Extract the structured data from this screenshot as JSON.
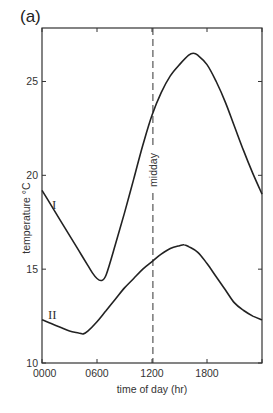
{
  "panel_label": "(a)",
  "chart_data": {
    "type": "line",
    "title": "",
    "xlabel": "time of day (hr)",
    "ylabel": "temperature °C",
    "xlim": [
      0,
      24
    ],
    "ylim": [
      10,
      27.5
    ],
    "x_ticks": [
      0,
      6,
      12,
      18,
      24
    ],
    "x_tick_labels": [
      "0000",
      "0600",
      "1200",
      "1800",
      ""
    ],
    "y_ticks": [
      10,
      15,
      20,
      25
    ],
    "y_tick_labels": [
      "10",
      "15",
      "20",
      "25"
    ],
    "grid": false,
    "legend": "none",
    "annotations": [
      {
        "type": "vline",
        "x": 12.1,
        "style": "dashed",
        "label": "midday"
      }
    ],
    "series": [
      {
        "name": "I",
        "x": [
          0,
          1,
          2,
          3,
          4,
          5,
          5.5,
          6,
          6.5,
          7,
          8,
          9,
          10,
          11,
          12,
          13,
          14,
          15,
          16,
          16.5,
          17,
          18,
          19,
          20,
          21,
          22,
          23,
          24
        ],
        "values": [
          19.2,
          18.4,
          17.6,
          16.8,
          16.0,
          15.2,
          14.8,
          14.5,
          14.4,
          14.7,
          16.3,
          18.0,
          19.8,
          21.6,
          23.2,
          24.4,
          25.3,
          25.9,
          26.4,
          26.5,
          26.4,
          25.9,
          25.0,
          23.9,
          22.6,
          21.3,
          20.1,
          19.0
        ]
      },
      {
        "name": "II",
        "x": [
          0,
          1,
          2,
          3,
          4,
          4.5,
          5,
          6,
          7,
          8,
          9,
          10,
          11,
          12,
          13,
          14,
          15,
          15.5,
          16,
          17,
          18,
          19,
          20,
          21,
          22,
          23,
          24
        ],
        "values": [
          12.3,
          12.1,
          11.9,
          11.7,
          11.6,
          11.55,
          11.7,
          12.2,
          12.8,
          13.4,
          14.0,
          14.5,
          15.0,
          15.4,
          15.8,
          16.1,
          16.25,
          16.3,
          16.2,
          15.9,
          15.3,
          14.6,
          13.9,
          13.2,
          12.8,
          12.5,
          12.3
        ]
      }
    ]
  }
}
